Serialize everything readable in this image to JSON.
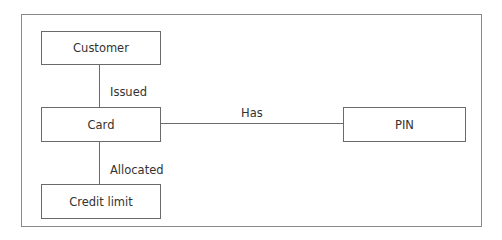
{
  "diagram": {
    "entities": [
      {
        "id": "customer",
        "label": "Customer"
      },
      {
        "id": "card",
        "label": "Card"
      },
      {
        "id": "credit_limit",
        "label": "Credit limit"
      },
      {
        "id": "pin",
        "label": "PIN"
      }
    ],
    "relationships": [
      {
        "from": "customer",
        "to": "card",
        "label": "Issued"
      },
      {
        "from": "card",
        "to": "pin",
        "label": "Has"
      },
      {
        "from": "card",
        "to": "credit_limit",
        "label": "Allocated"
      }
    ]
  }
}
